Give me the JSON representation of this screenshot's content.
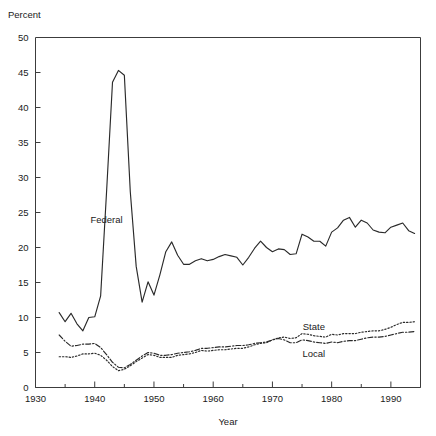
{
  "chart_data": {
    "type": "line",
    "title": "",
    "xlabel": "Year",
    "ylabel": "Percent",
    "xlim": [
      1930,
      1995
    ],
    "ylim": [
      0,
      50
    ],
    "grid": false,
    "legend_position": "inline-annotation",
    "xticks": [
      1930,
      1940,
      1950,
      1960,
      1970,
      1980,
      1990
    ],
    "xtick_labels": [
      "1930",
      "1940",
      "1950",
      "1960",
      "1970",
      "1980",
      "1990"
    ],
    "xminor_interval": 5,
    "yticks": [
      0,
      5,
      10,
      15,
      20,
      25,
      30,
      35,
      40,
      45,
      50
    ],
    "ytick_labels": [
      "0",
      "5",
      "10",
      "15",
      "20",
      "25",
      "30",
      "35",
      "40",
      "45",
      "50"
    ],
    "x": [
      1934,
      1935,
      1936,
      1937,
      1938,
      1939,
      1940,
      1941,
      1942,
      1943,
      1944,
      1945,
      1946,
      1947,
      1948,
      1949,
      1950,
      1951,
      1952,
      1953,
      1954,
      1955,
      1956,
      1957,
      1958,
      1959,
      1960,
      1961,
      1962,
      1963,
      1964,
      1965,
      1966,
      1967,
      1968,
      1969,
      1970,
      1971,
      1972,
      1973,
      1974,
      1975,
      1976,
      1977,
      1978,
      1979,
      1980,
      1981,
      1982,
      1983,
      1984,
      1985,
      1986,
      1987,
      1988,
      1989,
      1990,
      1991,
      1992,
      1993,
      1994
    ],
    "series": [
      {
        "name": "Federal",
        "label": "Federal",
        "linestyle": "solid",
        "color": "#2a2a2a",
        "label_x": 1942,
        "label_y": 23.5,
        "values": [
          10.7,
          9.4,
          10.6,
          9.1,
          8.1,
          10.0,
          10.1,
          13.1,
          28.0,
          43.6,
          45.3,
          44.6,
          28.0,
          17.3,
          12.2,
          15.1,
          13.2,
          16.1,
          19.4,
          20.8,
          18.9,
          17.6,
          17.6,
          18.1,
          18.4,
          18.1,
          18.3,
          18.7,
          19.0,
          18.8,
          18.6,
          17.5,
          18.6,
          19.9,
          20.9,
          20.0,
          19.4,
          19.8,
          19.7,
          19.0,
          19.1,
          21.9,
          21.5,
          20.9,
          20.9,
          20.2,
          22.2,
          22.8,
          23.9,
          24.3,
          22.9,
          23.9,
          23.5,
          22.5,
          22.2,
          22.1,
          22.9,
          23.2,
          23.5,
          22.4,
          22.0
        ]
      },
      {
        "name": "State",
        "label": "State",
        "linestyle": "dotted",
        "color": "#2a2a2a",
        "label_x": 1977,
        "label_y": 8.2,
        "values": [
          4.4,
          4.4,
          4.3,
          4.5,
          4.8,
          4.8,
          4.9,
          4.6,
          3.9,
          3.0,
          2.4,
          2.6,
          3.1,
          3.7,
          4.2,
          4.7,
          4.6,
          4.3,
          4.3,
          4.3,
          4.6,
          4.7,
          4.8,
          5.0,
          5.3,
          5.2,
          5.3,
          5.4,
          5.4,
          5.5,
          5.6,
          5.6,
          5.8,
          6.1,
          6.3,
          6.4,
          6.8,
          7.1,
          7.2,
          7.0,
          7.1,
          7.7,
          7.6,
          7.4,
          7.3,
          7.2,
          7.6,
          7.5,
          7.7,
          7.7,
          7.7,
          7.9,
          8.0,
          8.1,
          8.1,
          8.3,
          8.6,
          9.0,
          9.3,
          9.3,
          9.4
        ]
      },
      {
        "name": "Local",
        "label": "Local",
        "linestyle": "dashdot",
        "color": "#2a2a2a",
        "label_x": 1977,
        "label_y": 4.3,
        "values": [
          7.5,
          6.6,
          5.9,
          6.0,
          6.2,
          6.2,
          6.3,
          5.7,
          4.7,
          3.6,
          2.9,
          2.8,
          3.3,
          3.9,
          4.5,
          5.0,
          4.9,
          4.6,
          4.6,
          4.7,
          4.9,
          5.0,
          5.1,
          5.3,
          5.6,
          5.6,
          5.7,
          5.8,
          5.8,
          5.9,
          6.0,
          6.0,
          6.1,
          6.3,
          6.4,
          6.5,
          6.8,
          7.0,
          6.8,
          6.4,
          6.4,
          6.8,
          6.7,
          6.5,
          6.4,
          6.3,
          6.5,
          6.4,
          6.6,
          6.7,
          6.7,
          6.9,
          7.1,
          7.2,
          7.2,
          7.3,
          7.5,
          7.7,
          7.9,
          7.9,
          8.0
        ]
      }
    ]
  },
  "axes": {
    "y_axis_title": "Percent",
    "x_axis_title": "Year"
  }
}
